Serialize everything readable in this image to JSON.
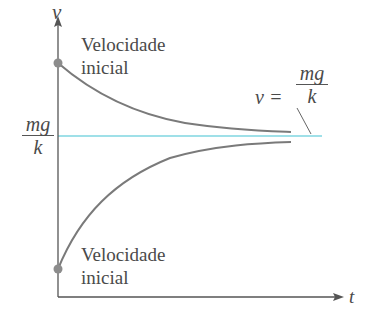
{
  "diagram": {
    "type": "velocity-vs-time",
    "axes": {
      "y_label": "v",
      "x_label": "t"
    },
    "terminal": {
      "left_label_num": "mg",
      "left_label_den": "k",
      "right_label_lhs": "v =",
      "right_label_num": "mg",
      "right_label_den": "k"
    },
    "annotations": [
      {
        "line1": "Velocidade",
        "line2": "inicial"
      },
      {
        "line1": "Velocidade",
        "line2": "inicial"
      }
    ],
    "colors": {
      "axis": "#555555",
      "curve": "#7a7a7a",
      "dot": "#8c8c8c",
      "terminal_line": "#7fd6e0",
      "text": "#4a4a4a"
    }
  }
}
